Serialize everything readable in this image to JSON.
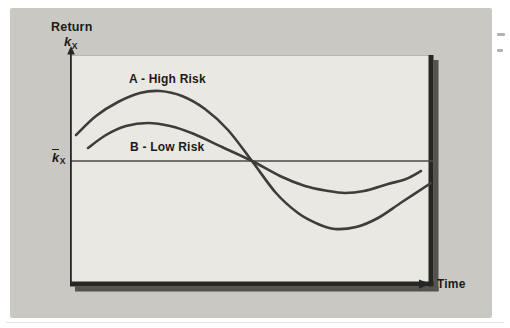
{
  "figure": {
    "y_axis_title": "Return",
    "y_axis_symbol": {
      "base": "k",
      "subscript": "X"
    },
    "mean_label": {
      "base": "k",
      "subscript": "X",
      "overbar": true
    },
    "x_axis_label": "Time",
    "series_labels": {
      "a": "A - High Risk",
      "b": "B - Low Risk"
    }
  },
  "colors": {
    "card_bg": "#c9c8c3",
    "plot_bg": "#e9e8e2",
    "plot_top_edge": "#b7b6b1",
    "curve": "#3d3d3b",
    "axis": "#262624",
    "shadow": "#55534e",
    "mean_line": "#4a4a46",
    "text": "#1b1b19"
  },
  "chart_data": {
    "type": "line",
    "title": "",
    "xlabel": "Time",
    "ylabel": "Return kX",
    "mean_line_label": "k̄X",
    "grid": false,
    "axes_numeric": false,
    "annotations": [
      "A - High Risk",
      "B - Low Risk"
    ],
    "x_range_px": [
      70,
      433
    ],
    "y_mean_px": 161,
    "plot_box_px": {
      "left": 70,
      "top": 55,
      "right": 433,
      "bottom": 285
    },
    "series": [
      {
        "name": "A - High Risk",
        "amplitude": "high",
        "points_px": [
          [
            76,
            135
          ],
          [
            96,
            116
          ],
          [
            118,
            102
          ],
          [
            140,
            93
          ],
          [
            160,
            91
          ],
          [
            182,
            96
          ],
          [
            205,
            109
          ],
          [
            228,
            130
          ],
          [
            252,
            161
          ],
          [
            276,
            193
          ],
          [
            298,
            213
          ],
          [
            318,
            224
          ],
          [
            335,
            229
          ],
          [
            356,
            227
          ],
          [
            378,
            218
          ],
          [
            402,
            202
          ],
          [
            431,
            183
          ]
        ]
      },
      {
        "name": "B - Low Risk",
        "amplitude": "low",
        "points_px": [
          [
            88,
            148
          ],
          [
            106,
            135
          ],
          [
            126,
            126
          ],
          [
            148,
            123
          ],
          [
            170,
            126
          ],
          [
            194,
            134
          ],
          [
            222,
            147
          ],
          [
            252,
            161
          ],
          [
            280,
            176
          ],
          [
            305,
            186
          ],
          [
            328,
            191
          ],
          [
            345,
            193
          ],
          [
            364,
            191
          ],
          [
            388,
            184
          ],
          [
            406,
            179
          ],
          [
            421,
            171
          ]
        ]
      }
    ]
  }
}
